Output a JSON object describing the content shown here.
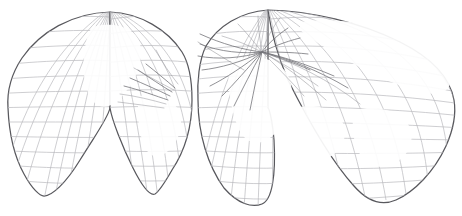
{
  "figure": {
    "kind": "interrupted-goode-homolosine-graticule",
    "background_color": "#ffffff",
    "outline_color": "#58585d",
    "graticule_color": "#b9b9bd",
    "graticule_faint_color": "#d3d3d7",
    "streak_color": "#6a6a70",
    "width": 462,
    "height": 216
  },
  "projection": {
    "interruptions": 4,
    "northern_lobes": 2,
    "southern_lobes": 4,
    "graticule_spacing_deg": 15,
    "equator_y": 108,
    "description": "Four-lobed southern hemisphere joined to two-lobed northern hemisphere"
  },
  "lobes": {
    "north": [
      {
        "name": "north-lobe-left",
        "apex_x": 110,
        "apex_y": 12,
        "left_x": 8,
        "right_x": 190
      },
      {
        "name": "north-lobe-right",
        "apex_x": 268,
        "apex_y": 10,
        "left_x": 196,
        "right_x": 454
      }
    ],
    "south": [
      {
        "name": "south-lobe-1",
        "base_x": 42,
        "base_y": 196,
        "left_x": 8,
        "right_x": 122
      },
      {
        "name": "south-lobe-2",
        "base_x": 156,
        "base_y": 196,
        "left_x": 124,
        "right_x": 196
      },
      {
        "name": "south-lobe-3",
        "base_x": 266,
        "base_y": 204,
        "left_x": 198,
        "right_x": 330
      },
      {
        "name": "south-lobe-4",
        "base_x": 390,
        "base_y": 200,
        "left_x": 332,
        "right_x": 454
      }
    ]
  },
  "pole_bursts": [
    {
      "name": "burst-center-right",
      "x": 262,
      "y": 52,
      "rays": 22,
      "length": 44
    },
    {
      "name": "burst-center-left",
      "x": 175,
      "y": 88,
      "rays": 12,
      "length": 38
    }
  ],
  "chart_data": {
    "type": "map",
    "xlabel": "",
    "ylabel": "",
    "meridian_interval_deg": 15,
    "parallel_interval_deg": 15,
    "lat_range": [
      -90,
      90
    ],
    "lon_range": [
      -180,
      180
    ],
    "legend": [],
    "grid": true
  }
}
